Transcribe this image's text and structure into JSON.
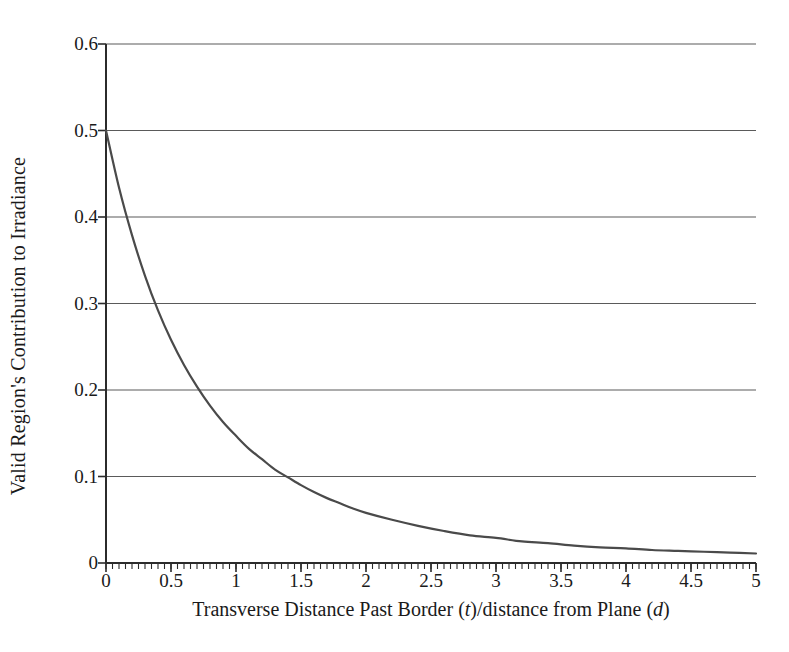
{
  "chart_data": {
    "type": "line",
    "title": "",
    "xlabel": "Transverse Distance Past Border (t)/distance from Plane (d)",
    "xlabel_parts": {
      "before_t": "Transverse Distance Past Border (",
      "italic_t": "t",
      "between": ")/distance from Plane (",
      "italic_d": "d",
      "after": ")"
    },
    "ylabel": "Valid Region's Contribution to Irradiance",
    "xlim": [
      0,
      5
    ],
    "ylim": [
      0,
      0.6
    ],
    "grid": true,
    "grid_axis": "y",
    "legend": "none",
    "xticks": [
      "0",
      "0.5",
      "1",
      "1.5",
      "2",
      "2.5",
      "3",
      "3.5",
      "4",
      "4.5",
      "5"
    ],
    "xtick_values": [
      0,
      0.5,
      1,
      1.5,
      2,
      2.5,
      3,
      3.5,
      4,
      4.5,
      5
    ],
    "xminor_interval": 0.05,
    "yticks": [
      "0",
      "0.1",
      "0.2",
      "0.3",
      "0.4",
      "0.5",
      "0.6"
    ],
    "ytick_values": [
      0,
      0.1,
      0.2,
      0.3,
      0.4,
      0.5,
      0.6
    ],
    "series": [
      {
        "name": "Valid region contribution",
        "color": "#4a4a4a",
        "linewidth": 2,
        "x": [
          0,
          0.1,
          0.2,
          0.3,
          0.4,
          0.5,
          0.6,
          0.7,
          0.8,
          0.9,
          1.0,
          1.1,
          1.2,
          1.3,
          1.4,
          1.5,
          1.6,
          1.7,
          1.8,
          1.9,
          2.0,
          2.2,
          2.4,
          2.6,
          2.8,
          3.0,
          3.2,
          3.4,
          3.6,
          3.8,
          4.0,
          4.2,
          4.4,
          4.6,
          4.8,
          5.0
        ],
        "y": [
          0.5,
          0.434,
          0.379,
          0.332,
          0.292,
          0.258,
          0.229,
          0.204,
          0.182,
          0.163,
          0.147,
          0.132,
          0.12,
          0.108,
          0.099,
          0.09,
          0.082,
          0.075,
          0.069,
          0.063,
          0.058,
          0.05,
          0.043,
          0.037,
          0.032,
          0.029,
          0.025,
          0.023,
          0.02,
          0.018,
          0.017,
          0.015,
          0.014,
          0.013,
          0.012,
          0.011
        ]
      }
    ],
    "colors": {
      "curve": "#4a4a4a",
      "gridline": "#5a5a5a",
      "axis": "#2b2b2b",
      "background": "#ffffff",
      "text": "#1a1a1a"
    }
  }
}
